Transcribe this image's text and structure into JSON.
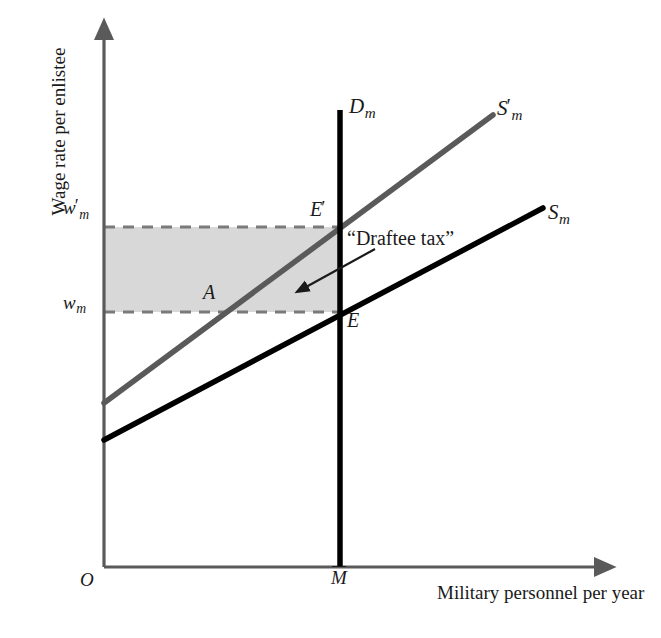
{
  "figure": {
    "kind": "economics-supply-demand-diagram",
    "background_color": "#ffffff",
    "axis_color": "#5a5a5a",
    "demand_color": "#000000",
    "supply_color": "#000000",
    "supply_shifted_color": "#5a5a5a",
    "shaded_area_color": "#d8d8d8",
    "dashed_line_color": "#7a7a7a",
    "text_color": "#1a1a1a"
  },
  "axes": {
    "y_title": "Wage rate per enlistee",
    "x_title": "Military personnel per year",
    "origin_label": "O",
    "y_ticks": [
      {
        "id": "w-prime",
        "base": "w",
        "prime": "′",
        "subscript": "m",
        "pixel_y": 227
      },
      {
        "id": "w",
        "base": "w",
        "prime": "",
        "subscript": "m",
        "pixel_y": 312
      }
    ],
    "x_ticks": [
      {
        "id": "m-bar",
        "base": "M",
        "overbar": true,
        "subscript": "",
        "pixel_x": 340
      }
    ]
  },
  "curves": [
    {
      "name": "demand-military",
      "label_base": "D",
      "label_subscript": "m",
      "label_prime": "",
      "type": "vertical-demand",
      "color": "#000000",
      "stroke_width": 5.5,
      "points": [
        [
          340,
          110
        ],
        [
          340,
          567
        ]
      ]
    },
    {
      "name": "supply-military-shifted",
      "label_base": "S",
      "label_subscript": "m",
      "label_prime": "′",
      "type": "upward-sloping-supply",
      "color": "#5a5a5a",
      "stroke_width": 5.5,
      "points": [
        [
          104,
          403
        ],
        [
          493,
          115
        ]
      ]
    },
    {
      "name": "supply-military",
      "label_base": "S",
      "label_subscript": "m",
      "label_prime": "",
      "type": "upward-sloping-supply",
      "color": "#000000",
      "stroke_width": 5.5,
      "points": [
        [
          104,
          440
        ],
        [
          543,
          208
        ]
      ]
    }
  ],
  "points": [
    {
      "id": "E-prime",
      "base": "E",
      "prime": "′",
      "x": 340,
      "y": 227,
      "label_dx": -30,
      "label_dy": -29
    },
    {
      "id": "E",
      "base": "E",
      "prime": "",
      "x": 340,
      "y": 312,
      "label_dx": 7,
      "label_dy": -2
    },
    {
      "id": "A",
      "base": "A",
      "prime": "",
      "x": 217,
      "y": 312,
      "label_dx": -14,
      "label_dy": -30
    }
  ],
  "annotations": [
    {
      "id": "draftee-tax",
      "text": "“Draftee tax”",
      "arrow_from": [
        375,
        249
      ],
      "arrow_to": [
        303,
        289
      ]
    }
  ],
  "shaded_region": {
    "id": "draftee-tax-area",
    "description": "rectangle between w_m and w'_m up to M-bar",
    "x0": 104,
    "x1": 340,
    "y0": 227,
    "y1": 312,
    "fill": "#d8d8d8"
  },
  "dashed_lines": [
    {
      "id": "w-prime-gridline",
      "x0": 104,
      "x1": 345,
      "y": 227
    },
    {
      "id": "w-gridline",
      "x0": 104,
      "x1": 345,
      "y": 312
    }
  ]
}
